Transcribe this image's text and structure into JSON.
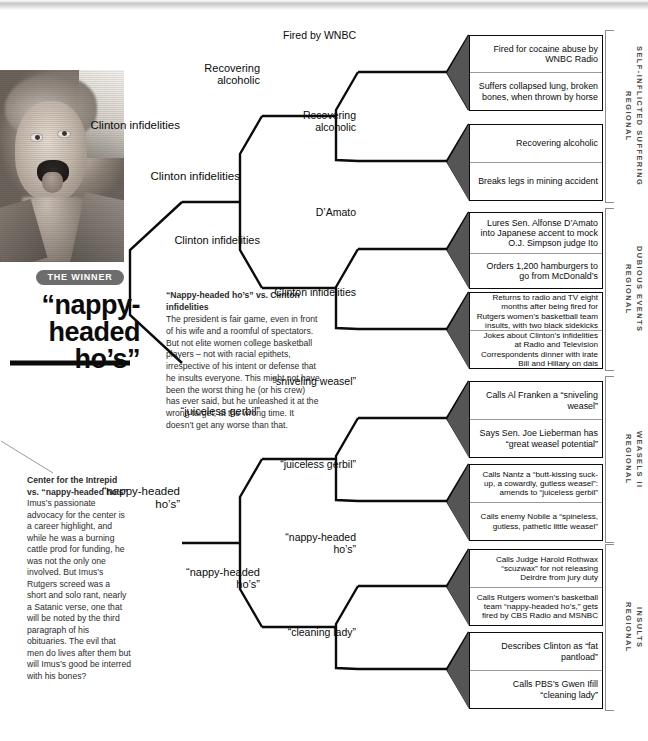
{
  "winner": {
    "badge": "THE WINNER",
    "title": "“nappy-\nheaded\nho’s”"
  },
  "center_note": {
    "headline": "“Nappy-headed ho’s” vs. Clinton infidelities",
    "body": "The president is fair game, even in front of his wife and a roomful of spectators. But not elite women college basketball players – not with racial epithets, irrespective of his intent or defense that he insults everyone. This might not have been the worst thing he (or his crew) has ever said, but he unleashed it at the wrong target, at the wrong time. It doesn’t get any worse than that."
  },
  "left_note": {
    "headline": "Center for the Intrepid vs. “nappy-headed ho’s”",
    "body": "Imus’s passionate advocacy for the center is a career highlight, and while he was a burning cattle prod for funding, he was not the only one involved. But Imus’s Rutgers screed was a short and solo rant, nearly a Satanic verse, one that will be noted by the third paragraph of his obituaries. The evil that men do lives after them but will Imus’s good be interred with his bones?"
  },
  "round_final": {
    "label": "Clinton infidelities"
  },
  "round_semis": [
    {
      "label": "Clinton infidelities"
    },
    {
      "label": "Clinton infidelities"
    },
    {
      "label": "“nappy-headed\nho’s”"
    },
    {
      "label": "“nappy-headed\nho’s”"
    }
  ],
  "round_quarters": [
    {
      "label": "Recovering\nalcoholic"
    },
    {
      "label": "Clinton infidelities"
    },
    {
      "label": "“juiceless gerbil”"
    },
    {
      "label": "“nappy-headed\nho’s”"
    }
  ],
  "round_eights": [
    {
      "label": "Fired by WNBC"
    },
    {
      "label": "Recovering\nalcoholic"
    },
    {
      "label": "D’Amato"
    },
    {
      "label": "Clinton infidelities"
    },
    {
      "label": "“sniveling weasel”"
    },
    {
      "label": "“juiceless gerbil”"
    },
    {
      "label": "“nappy-headed\nho’s”"
    },
    {
      "label": "“cleaning lady”"
    }
  ],
  "regions": [
    {
      "name": "SELF-INFLICTED SUFFERING\nREGIONAL"
    },
    {
      "name": "DUBIOUS EVENTS\nREGIONAL"
    },
    {
      "name": "WEASELS II\nREGIONAL"
    },
    {
      "name": "INSULTS\nREGIONAL"
    }
  ],
  "matchups": [
    {
      "top": "Fired for cocaine abuse by WNBC Radio",
      "bottom": "Suffers collapsed lung, broken bones, when thrown by horse"
    },
    {
      "top": "Recovering alcoholic",
      "bottom": "Breaks legs in mining accident"
    },
    {
      "top": "Lures Sen. Alfonse D’Amato into Japanese accent to mock O.J. Simpson judge Ito",
      "bottom": "Orders 1,200 hamburgers to go from McDonald’s"
    },
    {
      "top": "Returns to radio and TV eight months after being fired for Rutgers women’s basketball team insults, with two black sidekicks",
      "bottom": "Jokes about Clinton’s infidelities at Radio and Television Correspondents dinner with irate Bill and Hillary on dais"
    },
    {
      "top": "Calls Al Franken a “sniveling weasel”",
      "bottom": "Says Sen. Joe Lieberman has “great weasel potential”"
    },
    {
      "top": "Calls Nantz a “butt-kissing suck-up, a cowardly, gutless weasel”: amends to “juiceless gerbil”",
      "bottom": "Calls enemy Nobile a “spineless, gutless, pathetic little weasel”"
    },
    {
      "top": "Calls Judge Harold Rothwax “scuzwax” for not releasing Deirdre from jury duty",
      "bottom": "Calls Rutgers women’s basketball team “nappy-headed ho’s,” gets fired by CBS Radio and MSNBC"
    },
    {
      "top": "Describes Clinton as “fat pantload”",
      "bottom": "Calls PBS’s Gwen Ifill “cleaning lady”"
    }
  ],
  "colors": {
    "ink": "#0b0b0b",
    "wedge": "#555555",
    "badge_bg": "#6d6d6d",
    "bracket_gray": "#8d8d8d"
  }
}
